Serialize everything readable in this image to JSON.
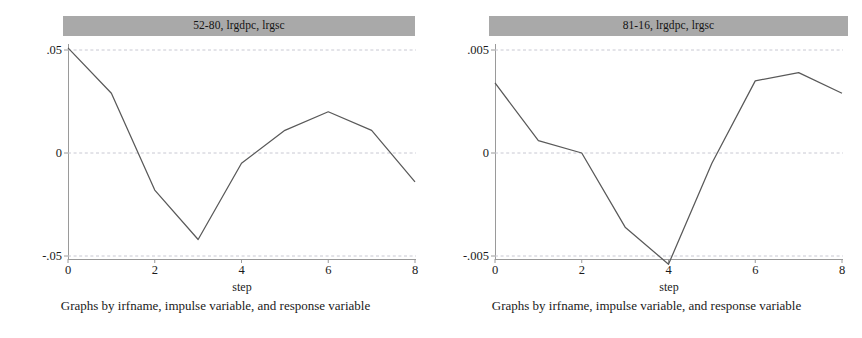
{
  "figure": {
    "caption": "Graphs by irfname, impulse variable, and response variable",
    "background": "#ffffff",
    "title_bar_color": "#a9a9a9",
    "line_color": "#595959",
    "grid_color": "#c8c8d2",
    "axis_color": "#9a9a9a"
  },
  "panels": [
    {
      "key": "left",
      "title": "52-80, lrgdpc, lrgsc",
      "xlabel": "step",
      "yticks": [
        ".05",
        "0",
        "-.05"
      ],
      "ytick_values": [
        0.05,
        0,
        -0.05
      ],
      "xticks": [
        "0",
        "2",
        "4",
        "6",
        "8"
      ],
      "xtick_values": [
        0,
        2,
        4,
        6,
        8
      ]
    },
    {
      "key": "right",
      "title": "81-16, lrgdpc, lrgsc",
      "xlabel": "step",
      "yticks": [
        ".005",
        "0",
        "-.005"
      ],
      "ytick_values": [
        0.005,
        0,
        -0.005
      ],
      "xticks": [
        "0",
        "2",
        "4",
        "6",
        "8"
      ],
      "xtick_values": [
        0,
        2,
        4,
        6,
        8
      ]
    }
  ],
  "chart_data": [
    {
      "type": "line",
      "title": "52-80, lrgdpc, lrgsc",
      "xlabel": "step",
      "ylabel": "",
      "x": [
        0,
        1,
        2,
        3,
        4,
        5,
        6,
        7,
        8
      ],
      "values": [
        0.051,
        0.029,
        -0.018,
        -0.042,
        -0.005,
        0.011,
        0.02,
        0.011,
        -0.014
      ],
      "xlim": [
        0,
        8
      ],
      "ylim": [
        -0.055,
        0.055
      ],
      "yticks": [
        0.05,
        0,
        -0.05
      ],
      "ytick_labels": [
        ".05",
        "0",
        "-.05"
      ],
      "xticks": [
        0,
        2,
        4,
        6,
        8
      ],
      "xtick_labels": [
        "0",
        "2",
        "4",
        "6",
        "8"
      ],
      "grid": "horizontal-dashed",
      "legend": "none",
      "series": [
        {
          "name": "irf",
          "values": [
            0.051,
            0.029,
            -0.018,
            -0.042,
            -0.005,
            0.011,
            0.02,
            0.011,
            -0.014
          ]
        }
      ]
    },
    {
      "type": "line",
      "title": "81-16, lrgdpc, lrgsc",
      "xlabel": "step",
      "ylabel": "",
      "x": [
        0,
        1,
        2,
        3,
        4,
        5,
        6,
        7,
        8
      ],
      "values": [
        0.0034,
        0.0006,
        0.0,
        -0.0036,
        -0.0054,
        -0.0005,
        0.0035,
        0.0039,
        0.0029
      ],
      "xlim": [
        0,
        8
      ],
      "ylim": [
        -0.0055,
        0.0055
      ],
      "yticks": [
        0.005,
        0,
        -0.005
      ],
      "ytick_labels": [
        ".005",
        "0",
        "-.005"
      ],
      "xticks": [
        0,
        2,
        4,
        6,
        8
      ],
      "xtick_labels": [
        "0",
        "2",
        "4",
        "6",
        "8"
      ],
      "grid": "horizontal-dashed",
      "legend": "none",
      "series": [
        {
          "name": "irf",
          "values": [
            0.0034,
            0.0006,
            0.0,
            -0.0036,
            -0.0054,
            -0.0005,
            0.0035,
            0.0039,
            0.0029
          ]
        }
      ]
    }
  ]
}
